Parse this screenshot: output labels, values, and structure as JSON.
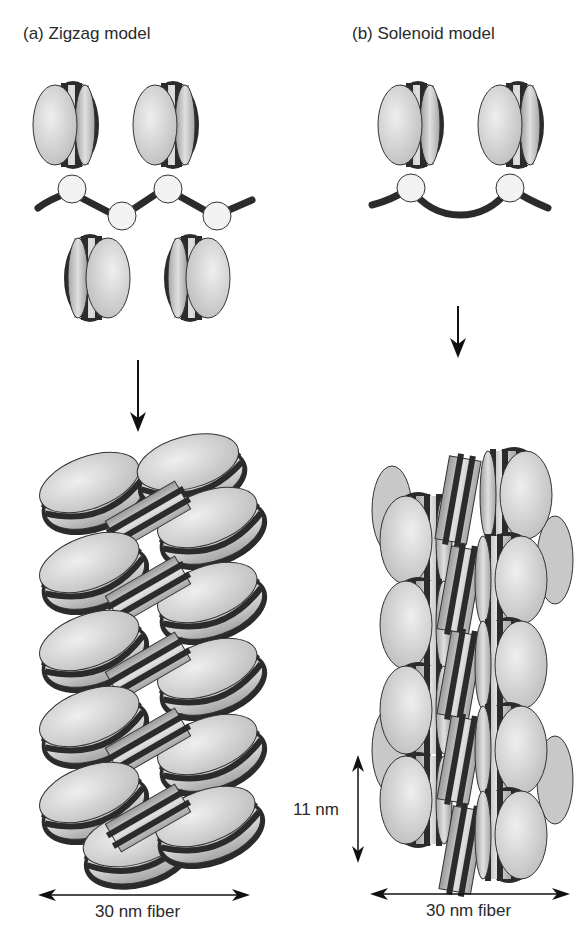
{
  "panels": [
    {
      "id": "a",
      "title": "(a)  Zigzag model",
      "fiber_label": "30 nm fiber"
    },
    {
      "id": "b",
      "title": "(b)  Solenoid model",
      "fiber_label": "30 nm fiber",
      "dimension_label": "11 nm"
    }
  ],
  "colors": {
    "nucleosome_face": "#d9d9d9",
    "nucleosome_side": "#bdbdbd",
    "dna_wrap": "#2b2b2b",
    "linker_histone": "#f2f2f2",
    "arrow": "#111111"
  }
}
